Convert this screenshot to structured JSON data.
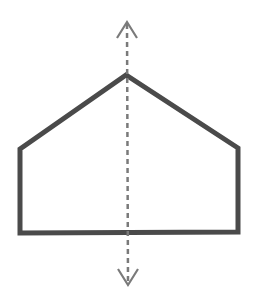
{
  "figure": {
    "title": "Pentagon with vertical line of symmetry",
    "shape": "pentagon",
    "shape_description": "House-shaped pentagon",
    "symmetry_axis": "vertical",
    "axis_style": "dashed double-headed arrow",
    "colors": {
      "background": "#ffffff",
      "outline": "#4a4a4a",
      "axis": "#7a7a7a"
    }
  }
}
